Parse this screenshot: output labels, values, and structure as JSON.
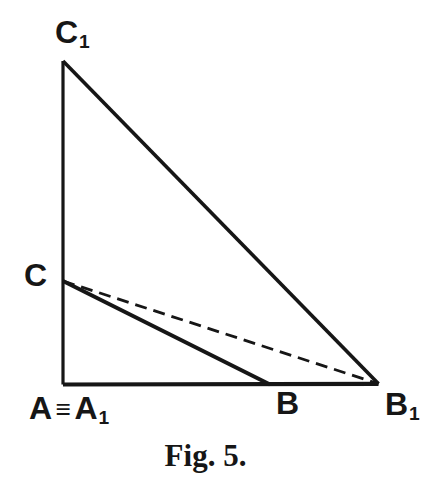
{
  "figure": {
    "caption": "Fig. 5.",
    "colors": {
      "ink": "#161616",
      "background": "#ffffff"
    },
    "labels": {
      "c1": {
        "base": "C",
        "sub": "1"
      },
      "c": {
        "base": "C"
      },
      "a_identity": {
        "a": "A",
        "equiv": "≡",
        "a1": "A",
        "a1_sub": "1"
      },
      "b": {
        "base": "B"
      },
      "b1": {
        "base": "B",
        "sub": "1"
      }
    },
    "geometry": {
      "points": {
        "A": [
          63,
          384.5
        ],
        "B": [
          270,
          384.5
        ],
        "C": [
          63,
          281
        ],
        "C1": [
          63,
          61
        ],
        "B1": [
          378.5,
          383.8
        ]
      },
      "segments": [
        {
          "name": "side-A-C1",
          "from": "A",
          "to": "C1",
          "style": "solid",
          "width": 3.2
        },
        {
          "name": "side-A-B1",
          "from": "A",
          "to": "B1",
          "style": "solid",
          "width": 4.2
        },
        {
          "name": "side-C1-B1",
          "from": "C1",
          "to": "B1",
          "style": "solid",
          "width": 3.6
        },
        {
          "name": "side-C-B",
          "from": "C",
          "to": "B",
          "style": "solid",
          "width": 4.0
        },
        {
          "name": "side-C-B1",
          "from": "C",
          "to": "B1",
          "style": "dashed",
          "width": 2.8,
          "dash": "12,7"
        }
      ]
    }
  }
}
